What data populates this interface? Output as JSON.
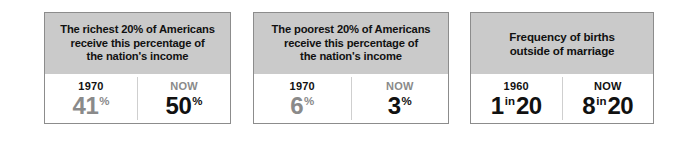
{
  "chart_data": {
    "type": "table",
    "title": "",
    "panels": [
      {
        "id": "richest-20-percent",
        "header": "The richest 20% of Americans receive this percentage of the nation's income",
        "header_lines": [
          "The richest 20% of Americans",
          "receive this percentage of",
          "the nation's income"
        ],
        "stats": [
          {
            "label": "1970",
            "label_emphasis": "dark",
            "value": "41",
            "unit": "%",
            "tail": "",
            "value_emphasis": "muted"
          },
          {
            "label": "NOW",
            "label_emphasis": "muted",
            "value": "50",
            "unit": "%",
            "tail": "",
            "value_emphasis": "dark"
          }
        ]
      },
      {
        "id": "poorest-20-percent",
        "header": "The poorest 20% of Americans receive this percentage of the nation's income",
        "header_lines": [
          "The poorest 20% of Americans",
          "receive this percentage of",
          "the nation's income"
        ],
        "stats": [
          {
            "label": "1970",
            "label_emphasis": "dark",
            "value": "6",
            "unit": "%",
            "tail": "",
            "value_emphasis": "muted"
          },
          {
            "label": "NOW",
            "label_emphasis": "muted",
            "value": "3",
            "unit": "%",
            "tail": "",
            "value_emphasis": "dark"
          }
        ]
      },
      {
        "id": "births-outside-marriage",
        "header": "Frequency of births outside of marriage",
        "header_lines": [
          "Frequency of births",
          "outside of marriage"
        ],
        "stats": [
          {
            "label": "1960",
            "label_emphasis": "dark",
            "value": "1",
            "unit": "in",
            "tail": "20",
            "value_emphasis": "dark"
          },
          {
            "label": "NOW",
            "label_emphasis": "dark",
            "value": "8",
            "unit": "in",
            "tail": "20",
            "value_emphasis": "dark"
          }
        ]
      }
    ],
    "colors": {
      "header_background": "#cacaca",
      "panel_border": "#8c8c8c",
      "page_background": "#ffffff",
      "text_dark": "#111111",
      "text_muted": "#8a8a8a",
      "divider": "#cfcfcf"
    }
  }
}
